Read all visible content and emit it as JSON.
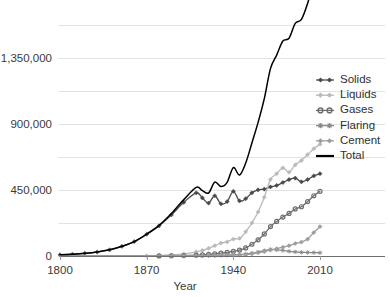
{
  "chart_data": {
    "type": "line",
    "title": "",
    "xlabel": "Year",
    "ylabel": "",
    "xlim": [
      1800,
      2010
    ],
    "ylim": [
      0,
      1687500
    ],
    "grid": true,
    "legend_position": "right",
    "y_ticks": [
      "0",
      "450,000",
      "900,000",
      "1,350,000"
    ],
    "y_tick_values": [
      0,
      450000,
      900000,
      1350000
    ],
    "x_ticks": [
      "1800",
      "1870",
      "1940",
      "2010"
    ],
    "x_tick_values": [
      1800,
      1870,
      1940,
      2010
    ],
    "gridline_values": [
      0,
      225000,
      450000,
      675000,
      900000,
      1125000,
      1350000,
      1575000
    ],
    "x": [
      1800,
      1810,
      1820,
      1830,
      1840,
      1850,
      1860,
      1870,
      1880,
      1890,
      1900,
      1910,
      1915,
      1920,
      1925,
      1930,
      1935,
      1940,
      1945,
      1950,
      1955,
      1960,
      1965,
      1970,
      1975,
      1980,
      1985,
      1990,
      1995,
      2000,
      2005,
      2010
    ],
    "series": [
      {
        "name": "Solids",
        "color": "#4a4a4a",
        "marker": "diamond",
        "values": [
          8000,
          12000,
          18000,
          27000,
          42000,
          66000,
          98000,
          148000,
          205000,
          280000,
          365000,
          430000,
          395000,
          360000,
          410000,
          355000,
          370000,
          440000,
          375000,
          390000,
          430000,
          450000,
          455000,
          470000,
          480000,
          500000,
          520000,
          530000,
          505000,
          520000,
          545000,
          560000
        ]
      },
      {
        "name": "Liquids",
        "color": "#b9b9b9",
        "marker": "diamond",
        "values": [
          0,
          0,
          0,
          0,
          0,
          0,
          0,
          1000,
          3000,
          7000,
          14000,
          28000,
          38000,
          52000,
          70000,
          88000,
          96000,
          115000,
          120000,
          165000,
          225000,
          300000,
          400000,
          520000,
          560000,
          600000,
          570000,
          620000,
          650000,
          690000,
          730000,
          760000
        ]
      },
      {
        "name": "Gases",
        "color": "#6e6e6e",
        "marker": "circle",
        "values": [
          0,
          0,
          0,
          0,
          0,
          0,
          0,
          0,
          500,
          1500,
          3000,
          6000,
          8000,
          11000,
          15000,
          20000,
          24000,
          32000,
          40000,
          55000,
          80000,
          110000,
          150000,
          200000,
          235000,
          265000,
          290000,
          320000,
          335000,
          370000,
          410000,
          440000
        ]
      },
      {
        "name": "Flaring",
        "color": "#8a8a8a",
        "marker": "asterisk",
        "values": [
          0,
          0,
          0,
          0,
          0,
          0,
          0,
          0,
          0,
          0,
          500,
          1000,
          1500,
          2000,
          3000,
          4000,
          5000,
          7000,
          9000,
          13000,
          19000,
          27000,
          36000,
          45000,
          42000,
          38000,
          32000,
          28000,
          25000,
          24000,
          23000,
          22000
        ]
      },
      {
        "name": "Cement",
        "color": "#9d9d9d",
        "marker": "diamond",
        "values": [
          0,
          0,
          0,
          0,
          0,
          0,
          0,
          0,
          0,
          500,
          1000,
          2000,
          2500,
          3500,
          5000,
          6000,
          6500,
          8000,
          7000,
          10000,
          15000,
          22000,
          30000,
          40000,
          50000,
          60000,
          70000,
          85000,
          95000,
          115000,
          160000,
          200000
        ]
      },
      {
        "name": "Total",
        "color": "#000000",
        "marker": "none",
        "values": [
          8000,
          12000,
          18000,
          27000,
          42000,
          66000,
          98000,
          149000,
          208500,
          289000,
          383500,
          467000,
          445000,
          428500,
          503000,
          473000,
          501500,
          602000,
          551000,
          633000,
          769000,
          909000,
          1071000,
          1275000,
          1367000,
          1463000,
          1482000,
          1583000,
          1610000,
          1719000,
          1868000,
          1982000
        ]
      }
    ],
    "legend": [
      {
        "label": "Solids",
        "color": "#4a4a4a",
        "marker": "diamond"
      },
      {
        "label": "Liquids",
        "color": "#b9b9b9",
        "marker": "diamond"
      },
      {
        "label": "Gases",
        "color": "#6e6e6e",
        "marker": "circle"
      },
      {
        "label": "Flaring",
        "color": "#8a8a8a",
        "marker": "asterisk"
      },
      {
        "label": "Cement",
        "color": "#9d9d9d",
        "marker": "diamond"
      },
      {
        "label": "Total",
        "color": "#000000",
        "marker": "none"
      }
    ]
  },
  "axes": {
    "x_title": "Year"
  }
}
